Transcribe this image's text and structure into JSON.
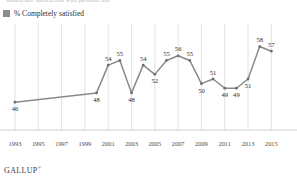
{
  "top_headline_fragment": "Americans' satisfaction with personal life",
  "legend": {
    "swatch_color": "#8c8c8c",
    "label": "% Completely satisfied"
  },
  "footer": {
    "brand": "GALLUP",
    "mark": "®"
  },
  "colors": {
    "line": "#8a8a8a",
    "marker": "#6f6f6f",
    "grid": "#cfcfcf",
    "axis": "#b5b5b5",
    "label_text": "#2e2e2e"
  },
  "chart_data": {
    "type": "line",
    "title": "",
    "xlabel": "",
    "ylabel": "",
    "grid": "vertical-only",
    "legend_position": "top-left",
    "xlim": [
      1993,
      2016
    ],
    "ylim": [
      40,
      62
    ],
    "xticks": [
      1993,
      1995,
      1997,
      1999,
      2001,
      2003,
      2005,
      2007,
      2009,
      2011,
      2013,
      2015
    ],
    "series": [
      {
        "name": "% Completely satisfied",
        "x": [
          1993,
          2000,
          2001,
          2002,
          2003,
          2004,
          2005,
          2006,
          2007,
          2008,
          2009,
          2010,
          2011,
          2012,
          2013,
          2014,
          2015
        ],
        "values": [
          46,
          48,
          54,
          55,
          48,
          54,
          52,
          55,
          56,
          55,
          50,
          51,
          49,
          49,
          51,
          58,
          57
        ],
        "labels": [
          "46",
          "48",
          "54",
          "55",
          "48",
          "54",
          "52",
          "55",
          "56",
          "55",
          "50",
          "51",
          "49",
          "49",
          "51",
          "58",
          "57"
        ],
        "label_positions": [
          "below",
          "below",
          "above",
          "above",
          "below",
          "above",
          "below",
          "above",
          "above",
          "above",
          "below",
          "above",
          "below",
          "below",
          "below",
          "above",
          "above"
        ]
      }
    ]
  }
}
